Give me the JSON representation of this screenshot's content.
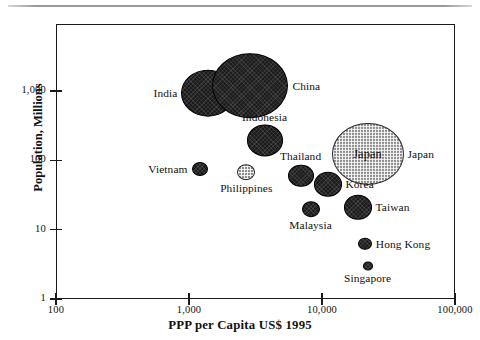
{
  "chart_data": {
    "type": "scatter",
    "title": "",
    "subtitle": "",
    "xlabel": "PPP per Capita US$ 1995",
    "ylabel": "Population, Millions",
    "xscale": "log",
    "yscale": "log",
    "xlim": [
      100,
      100000
    ],
    "ylim": [
      1,
      3000
    ],
    "grid": false,
    "legend": "none",
    "xticks": [
      "100",
      "1,000",
      "10,000",
      "100,000"
    ],
    "xtick_values": [
      100,
      1000,
      10000,
      100000
    ],
    "yticks": [
      "1,000",
      "100",
      "10",
      "1"
    ],
    "ytick_values": [
      1000,
      100,
      10,
      1
    ],
    "size_encoding": "bubble area ~ population",
    "points": [
      {
        "name": "India",
        "x": 1400,
        "y": 930,
        "r": 26,
        "fill": "dark",
        "label": "India",
        "label_pos": "left",
        "label_inside": false
      },
      {
        "name": "China",
        "x": 2900,
        "y": 1200,
        "r": 37,
        "fill": "dark",
        "label": "China",
        "label_pos": "right",
        "label_inside": false
      },
      {
        "name": "Indonesia",
        "x": 3700,
        "y": 195,
        "r": 17,
        "fill": "dark",
        "label": "Indonesia",
        "label_pos": "above",
        "label_inside": false
      },
      {
        "name": "Japan",
        "x": 22000,
        "y": 125,
        "r": 35,
        "fill": "light",
        "label": "Japan",
        "label_pos": "right",
        "label_inside": true
      },
      {
        "name": "Thailand",
        "x": 6900,
        "y": 60,
        "r": 12,
        "fill": "dark",
        "label": "Thailand",
        "label_pos": "above",
        "label_inside": false
      },
      {
        "name": "Korea",
        "x": 11000,
        "y": 45,
        "r": 13,
        "fill": "dark",
        "label": "Korea",
        "label_pos": "right",
        "label_inside": false
      },
      {
        "name": "Vietnam",
        "x": 1200,
        "y": 75,
        "r": 7,
        "fill": "dark",
        "label": "Vietnam",
        "label_pos": "left",
        "label_inside": false
      },
      {
        "name": "Philippines",
        "x": 2700,
        "y": 68,
        "r": 8,
        "fill": "light",
        "label": "Philippines",
        "label_pos": "below",
        "label_inside": false
      },
      {
        "name": "Taiwan",
        "x": 18500,
        "y": 21,
        "r": 13,
        "fill": "dark",
        "label": "Taiwan",
        "label_pos": "right",
        "label_inside": false
      },
      {
        "name": "Malaysia",
        "x": 8200,
        "y": 20,
        "r": 8,
        "fill": "dark",
        "label": "Malaysia",
        "label_pos": "below",
        "label_inside": false
      },
      {
        "name": "Hong Kong",
        "x": 21000,
        "y": 6.3,
        "r": 6,
        "fill": "dark",
        "label": "Hong Kong",
        "label_pos": "right",
        "label_inside": false
      },
      {
        "name": "Singapore",
        "x": 22000,
        "y": 3.0,
        "r": 4,
        "fill": "dark",
        "label": "Singapore",
        "label_pos": "below",
        "label_inside": false
      }
    ]
  },
  "axes": {
    "x_title": "PPP per Capita US$ 1995",
    "y_title": "Population, Millions",
    "x_tick_labels": [
      "100",
      "1,000",
      "10,000",
      "100,000"
    ],
    "y_tick_labels": [
      "1,000",
      "100",
      "10",
      "1"
    ]
  },
  "colors": {
    "frame": "#1a1a1a",
    "bubble_dark": "#1b1b1b",
    "bubble_light": "#8e8e8e",
    "text": "#111111",
    "top_rule": "#9a9a9a"
  }
}
